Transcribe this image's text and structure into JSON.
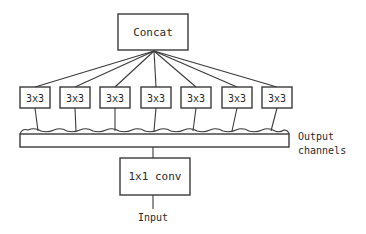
{
  "diagram": {
    "top_node": {
      "label": "Concat"
    },
    "branches": [
      {
        "label": "3x3"
      },
      {
        "label": "3x3"
      },
      {
        "label": "3x3"
      },
      {
        "label": "3x3"
      },
      {
        "label": "3x3"
      },
      {
        "label": "3x3"
      },
      {
        "label": "3x3"
      }
    ],
    "channel_bar": {
      "label_line1": "Output",
      "label_line2": "channels"
    },
    "bottom_node": {
      "label": "1x1 conv"
    },
    "input": {
      "label": "Input"
    },
    "colors": {
      "stroke": "#3a3a3a",
      "text": "#2a2a2a",
      "background": "#ffffff"
    }
  }
}
